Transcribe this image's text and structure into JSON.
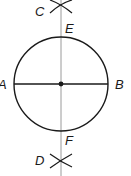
{
  "diagram": {
    "labels": {
      "A": "A",
      "B": "B",
      "C": "C",
      "D": "D",
      "E": "E",
      "F": "F"
    },
    "colors": {
      "stroke": "#1a1a1a",
      "bisector": "#9a9a9a",
      "background": "#ffffff"
    },
    "circle": {
      "cx": 61,
      "cy": 84,
      "r": 47
    },
    "diameter": {
      "from": "A",
      "to": "B"
    },
    "bisector": {
      "through": [
        "C",
        "E",
        "F",
        "D"
      ]
    }
  }
}
